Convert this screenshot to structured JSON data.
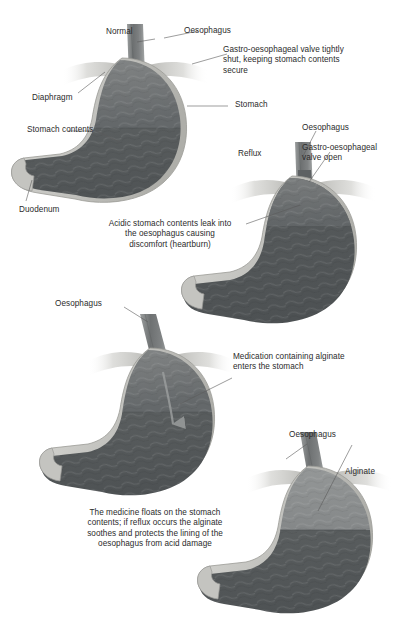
{
  "figure": {
    "width": 404,
    "height": 635,
    "background": "#ffffff",
    "text_color": "#2b2b2b"
  },
  "colors": {
    "contents_upper": "#7b7e7e",
    "contents_lower": "#55595a",
    "alginate_layer": "#8d9090",
    "stomach_wall": "#c9c9c5",
    "wall_shadow": "#9a9a96",
    "diaphragm": "#d6d6d3",
    "oesophagus": "#6f7272",
    "leader_line": "#5a5a5a",
    "text": "#2b2b2b"
  },
  "panels": [
    {
      "id": "panel-normal",
      "state_label": "Normal",
      "labels": [
        {
          "name": "state",
          "text": "Normal"
        },
        {
          "name": "oesophagus",
          "text": "Oesophagus"
        },
        {
          "name": "diaphragm",
          "text": "Diaphragm"
        },
        {
          "name": "stomach-contents",
          "text": "Stomach contents"
        },
        {
          "name": "stomach",
          "text": "Stomach"
        },
        {
          "name": "duodenum",
          "text": "Duodenum"
        }
      ],
      "caption": "Gastro-oesophageal valve tightly\nshut, keeping stomach contents\nsecure",
      "caption_align": "left"
    },
    {
      "id": "panel-reflux",
      "state_label": "Reflux",
      "labels": [
        {
          "name": "state",
          "text": "Reflux"
        },
        {
          "name": "oesophagus",
          "text": "Oesophagus"
        },
        {
          "name": "valve",
          "text": "Gastro-oesophageal\nvalve open"
        }
      ],
      "caption": "Acidic stomach contents leak into\nthe oesophagus causing\ndiscomfort (heartburn)",
      "caption_align": "center"
    },
    {
      "id": "panel-medication",
      "state_label": "",
      "labels": [
        {
          "name": "oesophagus",
          "text": "Oesophagus"
        }
      ],
      "caption": "Medication containing alginate\nenters the stomach",
      "caption_align": "left"
    },
    {
      "id": "panel-alginate",
      "state_label": "",
      "labels": [
        {
          "name": "oesophagus",
          "text": "Oesophagus"
        },
        {
          "name": "alginate",
          "text": "Alginate"
        }
      ],
      "caption": "The medicine floats on the stomach\ncontents; if reflux occurs the alginate\nsoothes and protects the lining of the\noesophagus from acid damage",
      "caption_align": "center"
    }
  ],
  "text": {
    "normal": "Normal",
    "reflux": "Reflux",
    "oesophagus_1": "Oesophagus",
    "oesophagus_2": "Oesophagus",
    "oesophagus_3": "Oesophagus",
    "oesophagus_4": "Oesophagus",
    "diaphragm": "Diaphragm",
    "stomach_contents": "Stomach contents",
    "stomach": "Stomach",
    "duodenum": "Duodenum",
    "alginate": "Alginate",
    "valve_shut": "Gastro-oesophageal valve tightly\nshut, keeping stomach contents\nsecure",
    "valve_open": "Gastro-oesophageal\nvalve open",
    "caption_reflux": "Acidic stomach contents leak into\nthe oesophagus causing\ndiscomfort (heartburn)",
    "caption_medication": "Medication containing alginate\nenters the stomach",
    "caption_alginate": "The medicine floats on the stomach\ncontents; if reflux occurs the alginate\nsoothes and protects the lining of the\noesophagus from acid damage"
  }
}
